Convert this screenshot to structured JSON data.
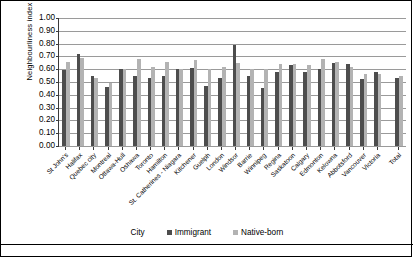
{
  "chart_data": {
    "type": "bar",
    "title": "",
    "xlabel": "City",
    "ylabel": "Neighbourliness  index",
    "ylim": [
      0.0,
      1.0
    ],
    "ytick_step": 0.1,
    "ytick_labels": [
      "1.00",
      "0.90",
      "0.80",
      "0.70",
      "0.60",
      "0.50",
      "0.40",
      "0.30",
      "0.20",
      "0.10",
      "0.00"
    ],
    "grid": true,
    "legend_position": "bottom",
    "categories": [
      "St John's",
      "Halifax",
      "Quebec city",
      "Montreal",
      "Ottawa-Hull",
      "Oshawa",
      "Toronto",
      "Hamilton",
      "St. Catherines - Niagara",
      "Kitchener",
      "Guelph",
      "London",
      "Windsor",
      "Barrie",
      "Winnipeg",
      "Regina",
      "Saskatoon",
      "Calgary",
      "Edmonton",
      "Kelowna",
      "Abbotsford",
      "Vancouver",
      "Victoria",
      "Total"
    ],
    "series": [
      {
        "name": "Immigrant",
        "color": "#4d4d4d",
        "values": [
          0.59,
          0.72,
          0.55,
          0.46,
          0.6,
          0.55,
          0.53,
          0.55,
          0.6,
          0.61,
          0.47,
          0.53,
          0.79,
          0.55,
          0.45,
          0.58,
          0.63,
          0.58,
          0.6,
          0.65,
          0.64,
          0.52,
          0.58,
          0.53
        ]
      },
      {
        "name": "Native-born",
        "color": "#b3b3b3",
        "values": [
          0.66,
          0.69,
          0.53,
          0.49,
          0.6,
          0.68,
          0.62,
          0.66,
          0.6,
          0.67,
          0.6,
          0.62,
          0.65,
          0.6,
          0.6,
          0.64,
          0.64,
          0.63,
          0.68,
          0.66,
          0.62,
          0.56,
          0.56,
          0.55
        ]
      }
    ]
  },
  "legend": [
    {
      "label": "Immigrant"
    },
    {
      "label": "Native-born"
    }
  ]
}
